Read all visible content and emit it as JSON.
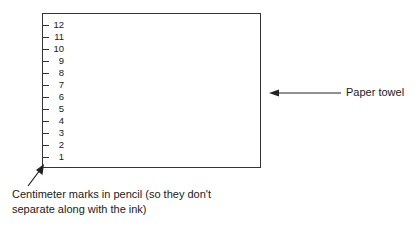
{
  "diagram": {
    "paper_towel_label": "Paper towel",
    "pencil_label_line1": "Centimeter marks in pencil (so they don't",
    "pencil_label_line2": "separate along with the ink)",
    "marks": [
      "12",
      "11",
      "10",
      "9",
      "8",
      "7",
      "6",
      "5",
      "4",
      "3",
      "2",
      "1"
    ]
  }
}
